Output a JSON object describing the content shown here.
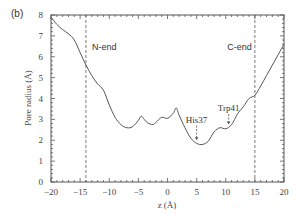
{
  "panel_label": "(b)",
  "chart_data": {
    "type": "line",
    "title": "",
    "xlabel": "z (Å)",
    "ylabel": "Pore radius (Å)",
    "xlim": [
      -20,
      20
    ],
    "ylim": [
      0,
      8
    ],
    "x_ticks": [
      -20,
      -15,
      -10,
      -5,
      0,
      5,
      10,
      15,
      20
    ],
    "x_tick_labels": [
      "−20",
      "−15",
      "−10",
      "−5",
      "0",
      "5",
      "10",
      "15",
      "20"
    ],
    "y_ticks": [
      0,
      1,
      2,
      3,
      4,
      5,
      6,
      7,
      8
    ],
    "y_tick_labels": [
      "0",
      "1",
      "2",
      "3",
      "4",
      "5",
      "6",
      "7",
      "8"
    ],
    "grid": false,
    "legend": null,
    "series": [
      {
        "name": "Pore radius",
        "color": "#555555",
        "x": [
          -20,
          -19,
          -18,
          -17,
          -16,
          -15,
          -14,
          -13,
          -12,
          -11,
          -10,
          -9,
          -8,
          -7,
          -6,
          -5,
          -4.5,
          -4,
          -3.5,
          -3,
          -2.5,
          -2,
          -1,
          0,
          1,
          1.5,
          2,
          3,
          4,
          5,
          6,
          7,
          8,
          9,
          10,
          11,
          12,
          13,
          14,
          15,
          16,
          17,
          18,
          19,
          20
        ],
        "values": [
          7.9,
          7.55,
          7.3,
          7.1,
          6.8,
          6.2,
          5.6,
          5.1,
          4.7,
          4.4,
          3.7,
          3.1,
          2.75,
          2.6,
          2.65,
          2.95,
          3.15,
          3.0,
          2.85,
          2.78,
          2.75,
          2.85,
          3.1,
          3.05,
          3.3,
          3.55,
          3.2,
          2.6,
          2.1,
          1.85,
          1.8,
          1.95,
          2.4,
          2.6,
          2.55,
          2.75,
          3.25,
          3.6,
          4.0,
          4.15,
          4.6,
          5.1,
          5.6,
          6.1,
          6.6
        ]
      }
    ],
    "vertical_lines": [
      {
        "x": -14,
        "style": "dashed",
        "label": "N-end"
      },
      {
        "x": 15,
        "style": "dashed",
        "label": "C-end"
      }
    ],
    "annotations": [
      {
        "text": "His37",
        "arrow_x": 5,
        "text_y": 2.85,
        "arrow_to_y": 2.0
      },
      {
        "text": "Trp41",
        "arrow_x": 10.5,
        "text_y": 3.4,
        "arrow_to_y": 2.75
      }
    ]
  }
}
